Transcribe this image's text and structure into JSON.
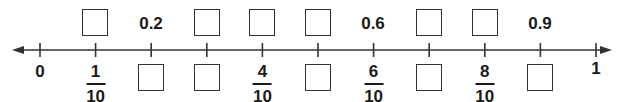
{
  "number_line": {
    "min_label": "0",
    "max_label": "1",
    "ticks": [
      {
        "index": 0,
        "top": "label",
        "top_text": "",
        "bottom": "label",
        "bottom_text": "0"
      },
      {
        "index": 1,
        "top": "box",
        "bottom": "fraction",
        "num": "1",
        "den": "10"
      },
      {
        "index": 2,
        "top": "label",
        "top_text": "0.2",
        "bottom": "box"
      },
      {
        "index": 3,
        "top": "box",
        "bottom": "box"
      },
      {
        "index": 4,
        "top": "box",
        "bottom": "fraction",
        "num": "4",
        "den": "10"
      },
      {
        "index": 5,
        "top": "box",
        "bottom": "box"
      },
      {
        "index": 6,
        "top": "label",
        "top_text": "0.6",
        "bottom": "fraction",
        "num": "6",
        "den": "10"
      },
      {
        "index": 7,
        "top": "box",
        "bottom": "box"
      },
      {
        "index": 8,
        "top": "box",
        "bottom": "fraction",
        "num": "8",
        "den": "10"
      },
      {
        "index": 9,
        "top": "label",
        "top_text": "0.9",
        "bottom": "box"
      },
      {
        "index": 10,
        "top": "none",
        "bottom": "label",
        "bottom_text": "1"
      }
    ]
  },
  "labels": {
    "zero": "0",
    "one": "1",
    "d2": "0.2",
    "d6": "0.6",
    "d9": "0.9",
    "f1n": "1",
    "f1d": "10",
    "f4n": "4",
    "f4d": "10",
    "f6n": "6",
    "f6d": "10",
    "f8n": "8",
    "f8d": "10"
  },
  "colors": {
    "line": "#333333",
    "text": "#1a1a1a"
  }
}
